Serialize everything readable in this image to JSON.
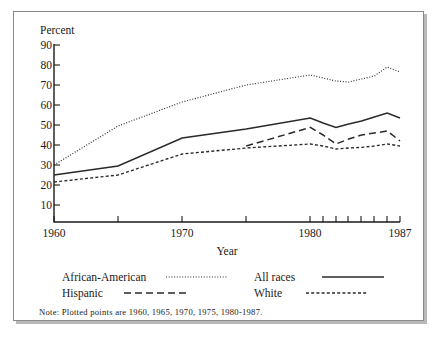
{
  "figure": {
    "y_axis_title": "Percent",
    "x_axis_title": "Year",
    "note": "Note: Plotted points are 1960, 1965, 1970, 1975, 1980-1987."
  },
  "chart_data": {
    "type": "line",
    "title": "",
    "xlabel": "Year",
    "ylabel": "Percent",
    "xlim": [
      1960,
      1987
    ],
    "ylim": [
      0,
      90
    ],
    "grid": false,
    "legend_position": "below-axes",
    "y_ticks": [
      10,
      20,
      30,
      40,
      50,
      60,
      70,
      80,
      90
    ],
    "x_ticks": [
      1960,
      1965,
      1970,
      1975,
      1980,
      1981,
      1982,
      1983,
      1984,
      1985,
      1986,
      1987
    ],
    "x_tick_labels": [
      "1960",
      "",
      "1970",
      "",
      "1980",
      "",
      "",
      "",
      "",
      "",
      "",
      "1987"
    ],
    "note": "Note: Plotted points are 1960, 1965, 1970, 1975, 1980-1987.",
    "series": [
      {
        "name": "African-American",
        "style": "dotted",
        "x": [
          1960,
          1965,
          1970,
          1975,
          1980,
          1981,
          1982,
          1983,
          1984,
          1985,
          1986,
          1987
        ],
        "values": [
          30.0,
          49.5,
          61.5,
          70.0,
          75.0,
          73.5,
          72.0,
          71.5,
          73.0,
          74.5,
          79.0,
          76.5
        ]
      },
      {
        "name": "All races",
        "style": "solid",
        "x": [
          1960,
          1965,
          1970,
          1975,
          1980,
          1981,
          1982,
          1983,
          1984,
          1985,
          1986,
          1987
        ],
        "values": [
          25.0,
          29.5,
          43.5,
          48.0,
          53.5,
          51.0,
          48.8,
          50.5,
          52.0,
          54.0,
          56.0,
          53.5
        ]
      },
      {
        "name": "Hispanic",
        "style": "long-dash",
        "x": [
          1975,
          1980,
          1981,
          1982,
          1983,
          1984,
          1985,
          1986,
          1987
        ],
        "values": [
          39.5,
          48.8,
          45.0,
          40.5,
          43.0,
          45.0,
          46.0,
          47.0,
          42.0
        ]
      },
      {
        "name": "White",
        "style": "short-dash",
        "x": [
          1960,
          1965,
          1970,
          1975,
          1980,
          1981,
          1982,
          1983,
          1984,
          1985,
          1986,
          1987
        ],
        "values": [
          21.5,
          25.0,
          35.5,
          38.5,
          40.5,
          39.5,
          38.0,
          38.5,
          38.8,
          39.5,
          40.5,
          39.5
        ]
      }
    ]
  },
  "legend": {
    "entries": [
      {
        "label": "African-American",
        "style": "dotted"
      },
      {
        "label": "All races",
        "style": "solid"
      },
      {
        "label": "Hispanic",
        "style": "long-dash"
      },
      {
        "label": "White",
        "style": "short-dash"
      }
    ]
  },
  "axis": {
    "y_tick_labels": [
      "90",
      "80",
      "70",
      "60",
      "50",
      "40",
      "30",
      "20",
      "10"
    ],
    "x_tick_labels": [
      "1960",
      "1970",
      "1980",
      "1987"
    ]
  }
}
